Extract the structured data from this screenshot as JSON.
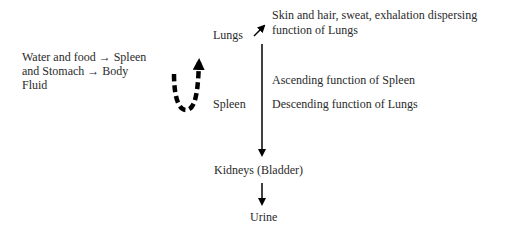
{
  "diagram": {
    "input_label_lines": [
      "Water and food → Spleen",
      "and Stomach → Body",
      "Fluid"
    ],
    "nodes": {
      "lungs": "Lungs",
      "spleen": "Spleen",
      "kidneys": "Kidneys (Bladder)",
      "urine": "Urine"
    },
    "lungs_output_lines": [
      "Skin and hair, sweat, exhalation dispersing",
      "function of Lungs"
    ],
    "ascending_label": "Ascending function of Spleen",
    "descending_label": "Descending function of Lungs",
    "colors": {
      "text": "#2a2a2a",
      "arrow": "#000000"
    }
  }
}
